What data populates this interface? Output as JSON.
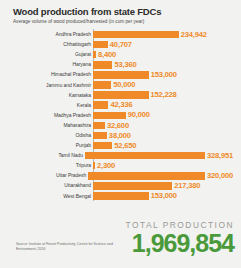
{
  "chart_data": {
    "type": "bar",
    "orientation": "horizontal",
    "title": "Wood production from state FDCs",
    "subtitle": "Average volume of wood produced/harvested (in cum per year)",
    "xlabel": "",
    "ylabel": "",
    "xlim": [
      0,
      328951
    ],
    "grid": false,
    "legend": "none",
    "categories": [
      "Andhra Pradesh",
      "Chhattisgarh",
      "Gujarat",
      "Haryana",
      "Himachal Pradesh",
      "Jammu and Kashmir",
      "Karnataka",
      "Kerala",
      "Madhya Pradesh",
      "Maharashtra",
      "Odisha",
      "Punjab",
      "Tamil Nadu",
      "Tripura",
      "Uttar Pradesh",
      "Uttarakhand",
      "West Bengal"
    ],
    "values": [
      234942,
      40707,
      8400,
      53360,
      153000,
      50000,
      152228,
      42336,
      90000,
      32600,
      38000,
      52650,
      328951,
      2300,
      320000,
      217380,
      153000
    ],
    "value_labels": [
      "234,942",
      "40,707",
      "8,400",
      "53,360",
      "153,000",
      "50,000",
      "152,228",
      "42,336",
      "90,000",
      "32,600",
      "38,000",
      "52,650",
      "328,951",
      "2,300",
      "320,000",
      "217,380",
      "153,000"
    ],
    "annotations": {
      "total_label": "TOTAL PRODUCTION",
      "total_value": "1,969,854",
      "total_numeric": 1969854
    },
    "colors": {
      "bar": "#f08a28",
      "value_text": "#f08a28",
      "total": "#4a9a3c",
      "background": "#f2f2f0",
      "title": "#2b2b2b"
    }
  },
  "source": {
    "text": "Source: Institute of Forest Productivity; Centre for Science and Environment, 2016"
  }
}
